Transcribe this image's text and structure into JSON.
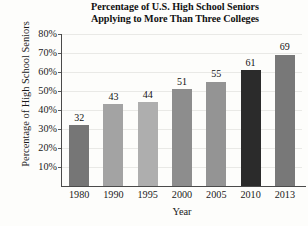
{
  "chart_data": {
    "type": "bar",
    "title": "Percentage of U.S. High School Seniors Applying to More Than Three Colleges",
    "title_lines": [
      "Percentage of U.S. High School Seniors",
      "Applying to More Than Three Colleges"
    ],
    "xlabel": "Year",
    "ylabel": "Percentage of High School Seniors",
    "categories": [
      "1980",
      "1990",
      "1995",
      "2000",
      "2005",
      "2010",
      "2013"
    ],
    "values": [
      32,
      43,
      44,
      51,
      55,
      61,
      69
    ],
    "value_labels": [
      "32",
      "43",
      "44",
      "51",
      "55",
      "61",
      "69"
    ],
    "bar_colors": [
      "#767676",
      "#a3a3a3",
      "#aeaeae",
      "#8d8d8d",
      "#949494",
      "#2b2b2b",
      "#787878"
    ],
    "ylim": [
      0,
      80
    ],
    "ytick_values": [
      10,
      20,
      30,
      40,
      50,
      60,
      70,
      80
    ],
    "ytick_labels": [
      "10%",
      "20%",
      "30%",
      "40%",
      "50%",
      "60%",
      "70%",
      "80%"
    ],
    "grid": true,
    "legend": null,
    "legend_position": "none",
    "units": "percent"
  },
  "style": {
    "background": "#fdfdfb",
    "axis_color": "#4a4a4a",
    "grid_color": "#e9e9e6",
    "text_color": "#1a1a1a"
  }
}
